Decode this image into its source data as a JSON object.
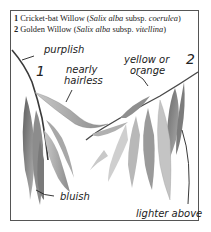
{
  "legend": {
    "items": [
      {
        "number": "1",
        "common_name": "Cricket-bat Willow",
        "open": " (",
        "genus_species": "Salix alba",
        "rank": " subsp. ",
        "subspecies": "coerulea",
        "close": ")"
      },
      {
        "number": "2",
        "common_name": "Golden Willow",
        "open": " (",
        "genus_species": "Salix alba",
        "rank": " subsp. ",
        "subspecies": "vitellina",
        "close": ")"
      }
    ]
  },
  "specimens": {
    "one": {
      "number": "1"
    },
    "two": {
      "number": "2"
    }
  },
  "annotations": {
    "purplish": "purplish",
    "nearly_hairless_1": "nearly",
    "nearly_hairless_2": "hairless",
    "yellow_orange_1": "yellow or",
    "yellow_orange_2": "orange",
    "bluish": "bluish",
    "lighter_above": "lighter above"
  },
  "colors": {
    "frame": "#555555",
    "text": "#222222",
    "leaf_dark": "#6f6f6f",
    "leaf_light": "#bdbdbd"
  }
}
